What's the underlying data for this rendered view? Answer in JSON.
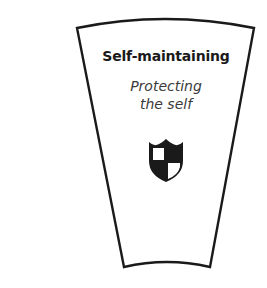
{
  "segment": {
    "title": "Self-maintaining",
    "subtitle_lines": [
      "Protecting",
      "the self"
    ],
    "icon": "shield-icon",
    "outline_color": "#1a1a1a",
    "fill_color": "#ffffff"
  }
}
